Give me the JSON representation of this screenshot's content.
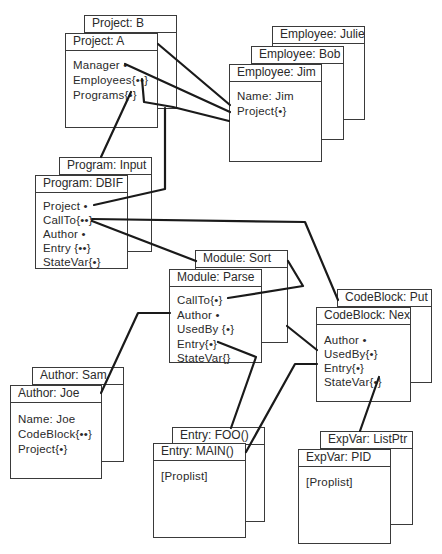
{
  "diagram": {
    "objects": {
      "project_b": {
        "title": "Project:  B"
      },
      "project_a": {
        "title": "Project:  A",
        "fields": [
          "Manager  •",
          "Employees{••}",
          "Programs{•}"
        ]
      },
      "employee_julie": {
        "title": "Employee:  Julie"
      },
      "employee_bob": {
        "title": "Employee: Bob"
      },
      "employee_jim": {
        "title": "Employee:  Jim",
        "fields": [
          "Name: Jim",
          "Project{•}"
        ]
      },
      "program_input": {
        "title": "Program:  Input"
      },
      "program_dbif": {
        "title": "Program: DBIF",
        "fields": [
          "Project  •",
          "CallTo{••}",
          "Author  •",
          "Entry  {••}",
          "StateVar{•}"
        ]
      },
      "module_sort": {
        "title": "Module:  Sort"
      },
      "module_parse": {
        "title": "Module: Parse",
        "fields": [
          "CallTo{•}",
          "Author   •",
          "UsedBy  {•}",
          "Entry{•}",
          "StateVar{}"
        ]
      },
      "codeblock_put": {
        "title": "CodeBlock:  Put"
      },
      "codeblock_next": {
        "title": "CodeBlock: Next",
        "fields": [
          "Author  •",
          "UsedBy{•}",
          "Entry{•}",
          "StateVar{•}"
        ]
      },
      "author_sam": {
        "title": "Author:  Sam"
      },
      "author_joe": {
        "title": "Author:  Joe",
        "fields": [
          "Name: Joe",
          "CodeBlock{••}",
          "Project{•}"
        ]
      },
      "entry_foo": {
        "title": "Entry: FOO()"
      },
      "entry_main": {
        "title": "Entry: MAIN()",
        "fields": [
          "[Proplist]"
        ]
      },
      "expvar_listptr": {
        "title": "ExpVar:  ListPtr"
      },
      "expvar_pid": {
        "title": "ExpVar: PID",
        "fields": [
          "[Proplist]"
        ]
      }
    },
    "connections": [
      {
        "from": "project_a.header",
        "to": "employee_jim.project"
      },
      {
        "from": "project_a.manager",
        "to": "employee_jim.project"
      },
      {
        "from": "project_a.employees",
        "to": "employee_jim"
      },
      {
        "from": "project_a.programs",
        "to": "program_input"
      },
      {
        "from": "project_b",
        "to": "program_dbif.project"
      },
      {
        "from": "program_dbif.callto",
        "to": "module_sort"
      },
      {
        "from": "program_dbif.callto",
        "to": "codeblock_put"
      },
      {
        "from": "module_parse.callto",
        "to": "module_sort"
      },
      {
        "from": "module_parse.author",
        "to": "author_joe"
      },
      {
        "from": "module_parse.entry",
        "to": "entry_foo"
      },
      {
        "from": "module_sort",
        "to": "codeblock_next.usedby"
      },
      {
        "from": "codeblock_next.entry",
        "to": "entry_main"
      },
      {
        "from": "codeblock_next.statevar",
        "to": "expvar_listptr"
      }
    ],
    "colors": {
      "line": "#1a1a1a",
      "border": "#3a3a3a",
      "text": "#2a2a2a",
      "background": "#ffffff"
    }
  }
}
